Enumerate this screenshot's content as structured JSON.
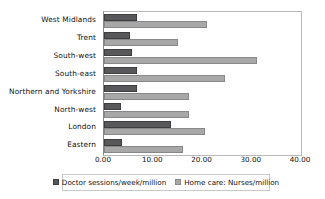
{
  "chart_data": {
    "type": "bar",
    "orientation": "horizontal",
    "title": "",
    "xlabel": "",
    "ylabel": "",
    "xlim": [
      0,
      40
    ],
    "grid": false,
    "legend_position": "bottom",
    "tick_labels": [
      "0.00",
      "10.00",
      "20.00",
      "30.00",
      "40.00"
    ],
    "tick_values": [
      0,
      10,
      20,
      30,
      40
    ],
    "categories": [
      "West Midlands",
      "Trent",
      "South-west",
      "South-east",
      "Northern and Yorkshire",
      "North-west",
      "London",
      "Eastern"
    ],
    "series": [
      {
        "name": "Doctor sessions/week/million",
        "color": "#58585a",
        "values": [
          6.8,
          5.3,
          5.7,
          6.8,
          6.7,
          3.5,
          13.6,
          3.7
        ]
      },
      {
        "name": "Home care: Nurses/million",
        "color": "#a8a8a8",
        "values": [
          20.9,
          15.0,
          31.0,
          24.6,
          17.2,
          17.2,
          20.5,
          16.0
        ]
      }
    ]
  }
}
